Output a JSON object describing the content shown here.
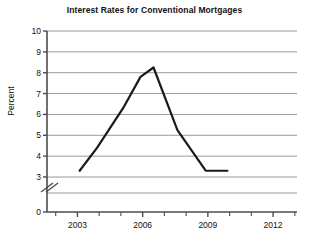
{
  "chart_data": {
    "type": "line",
    "title": "Interest Rates for Conventional Mortgages",
    "xlabel": "",
    "ylabel": "Percent",
    "x": [
      2003.1,
      2003.9,
      2005.1,
      2005.9,
      2006.5,
      2007.6,
      2008.9,
      2009.9
    ],
    "values": [
      3.3,
      4.4,
      6.3,
      7.8,
      8.25,
      5.25,
      3.3,
      3.3
    ],
    "series": [
      {
        "name": "Interest Rate",
        "points": [
          {
            "x": 2003.1,
            "y": 3.3
          },
          {
            "x": 2003.9,
            "y": 4.4
          },
          {
            "x": 2005.1,
            "y": 6.3
          },
          {
            "x": 2005.9,
            "y": 7.8
          },
          {
            "x": 2006.5,
            "y": 8.25
          },
          {
            "x": 2007.6,
            "y": 5.25
          },
          {
            "x": 2008.9,
            "y": 3.3
          },
          {
            "x": 2009.9,
            "y": 3.3
          }
        ]
      }
    ],
    "xlim": [
      2001.6,
      2013.1
    ],
    "ylim": [
      3,
      10
    ],
    "y_axis_break": true,
    "y_break_below": 3,
    "y_zero_label": "0",
    "xticks": [
      2003,
      2006,
      2009,
      2012
    ],
    "xtick_labels": [
      "2003",
      "2006",
      "2009",
      "2012"
    ],
    "x_minor_ticks": [
      2002,
      2004,
      2005,
      2007,
      2008,
      2010,
      2011,
      2013
    ],
    "yticks": [
      3,
      4,
      5,
      6,
      7,
      8,
      9,
      10
    ],
    "ytick_labels": [
      "3",
      "4",
      "5",
      "6",
      "7",
      "8",
      "9",
      "10"
    ],
    "grid": true,
    "grid_axis": "y",
    "legend": "none",
    "line_color": "#1a1a1a",
    "grid_color": "#9a9a9a",
    "axis_color": "#4d4d4d",
    "background": "#ffffff"
  }
}
